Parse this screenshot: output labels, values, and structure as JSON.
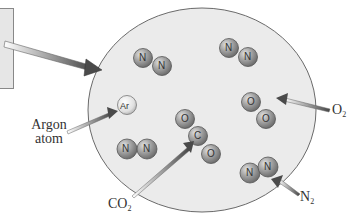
{
  "diagram": {
    "container": {
      "shape": "ellipse",
      "fill": "#ebebeb",
      "stroke": "#666666"
    },
    "colors": {
      "atom_fill": "#9a9a9a",
      "atom_highlight": "#d8d8d8",
      "argon_fill": "#e8e8e8",
      "arrow_dark": "#555555",
      "arrow_light": "#ffffff",
      "background": "#ffffff"
    },
    "molecules": [
      {
        "id": "n2-top-left",
        "type": "N2",
        "atoms": [
          "N",
          "N"
        ]
      },
      {
        "id": "n2-top-right",
        "type": "N2",
        "atoms": [
          "N",
          "N"
        ]
      },
      {
        "id": "argon",
        "type": "Ar",
        "atoms": [
          "Ar"
        ]
      },
      {
        "id": "co2",
        "type": "CO2",
        "atoms": [
          "O",
          "C",
          "O"
        ]
      },
      {
        "id": "o2",
        "type": "O2",
        "atoms": [
          "O",
          "O"
        ]
      },
      {
        "id": "n2-bottom-left",
        "type": "N2",
        "atoms": [
          "N",
          "N"
        ]
      },
      {
        "id": "n2-bottom-right",
        "type": "N2",
        "atoms": [
          "N",
          "N"
        ]
      }
    ],
    "labels": {
      "argon_line1": "Argon",
      "argon_line2": "atom",
      "co2_main": "CO",
      "co2_sub": "2",
      "o2_main": "O",
      "o2_sub": "2",
      "n2_main": "N",
      "n2_sub": "2"
    },
    "atom_letters": {
      "n": "N",
      "o": "O",
      "c": "C",
      "ar": "Ar"
    }
  }
}
